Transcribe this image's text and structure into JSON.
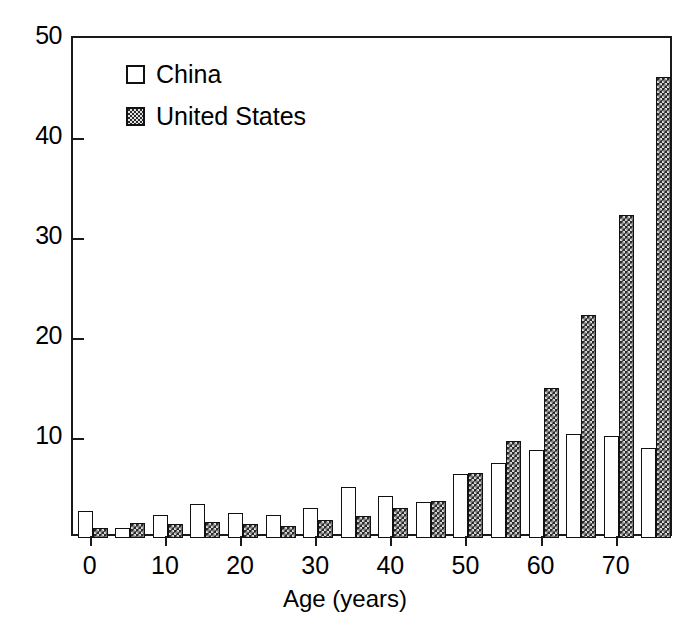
{
  "chart_data": {
    "type": "bar",
    "title": "",
    "xlabel": "Age (years)",
    "ylabel": "",
    "xlim": [
      -2.5,
      77.5
    ],
    "ylim": [
      0,
      50
    ],
    "grid": false,
    "legend_position": "top-left",
    "x_tick_labels": [
      "0",
      "10",
      "20",
      "30",
      "40",
      "50",
      "60",
      "70"
    ],
    "x_tick_values": [
      0,
      10,
      20,
      30,
      40,
      50,
      60,
      70
    ],
    "y_tick_labels": [
      "10",
      "20",
      "30",
      "40",
      "50"
    ],
    "y_tick_values": [
      10,
      20,
      30,
      40,
      50
    ],
    "categories": [
      0,
      5,
      10,
      15,
      20,
      25,
      30,
      35,
      40,
      45,
      50,
      55,
      60,
      65,
      70,
      75
    ],
    "series": [
      {
        "name": "China",
        "color": "#ffffff",
        "pattern": "solid-white",
        "values": [
          2.7,
          1.0,
          2.3,
          3.4,
          2.5,
          2.3,
          3.0,
          5.1,
          4.2,
          3.6,
          6.4,
          7.5,
          8.8,
          10.4,
          10.2,
          9.0
        ]
      },
      {
        "name": "United States",
        "color": "#2a2a2a",
        "pattern": "checkered",
        "values": [
          1.0,
          1.5,
          1.4,
          1.6,
          1.4,
          1.2,
          1.8,
          2.2,
          3.0,
          3.7,
          6.5,
          9.7,
          15.0,
          22.3,
          32.3,
          46.1
        ]
      }
    ]
  },
  "legend": {
    "items": [
      {
        "label": "China",
        "swatch": "white-square"
      },
      {
        "label": "United States",
        "swatch": "checkered-square"
      }
    ]
  },
  "axis": {
    "x_title": "Age (years)"
  }
}
